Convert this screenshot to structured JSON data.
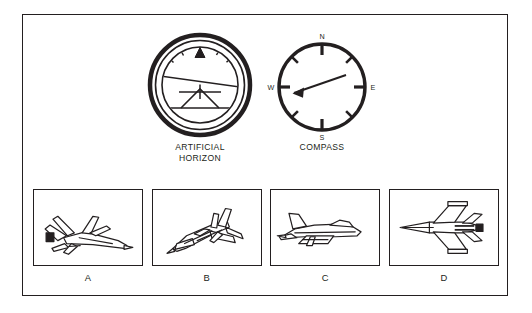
{
  "figure": {
    "background_color": "#ffffff",
    "line_color": "#231f20",
    "frame_border_color": "#231f20"
  },
  "instruments": [
    {
      "id": "artificial-horizon",
      "caption": "ARTIFICIAL\nHORIZON",
      "type": "attitude-indicator",
      "reading": {
        "roll_degrees": -8,
        "pitch": "slightly nose-down",
        "pointer_position_degrees": 0,
        "horizon_line_tilt_degrees": -8
      }
    },
    {
      "id": "compass",
      "caption": "COMPASS",
      "type": "magnetic-compass",
      "cardinal_labels": {
        "north": "N",
        "east": "E",
        "south": "S",
        "west": "W"
      },
      "tick_count": 8,
      "reading": {
        "needle_heading_degrees": 252,
        "needle_direction": "west-southwest"
      }
    }
  ],
  "aircraft_panels": [
    {
      "id": "panel-a",
      "label": "A",
      "view": "rear-quarter-from-above",
      "description": "fighter jet seen from behind and above, banking"
    },
    {
      "id": "panel-b",
      "label": "B",
      "view": "front-quarter-from-above",
      "description": "fighter jet seen from the front-left above"
    },
    {
      "id": "panel-c",
      "label": "C",
      "view": "side-profile",
      "description": "fighter jet seen from the left side"
    },
    {
      "id": "panel-d",
      "label": "D",
      "view": "plan-from-above",
      "description": "fighter jet seen directly from above"
    }
  ]
}
